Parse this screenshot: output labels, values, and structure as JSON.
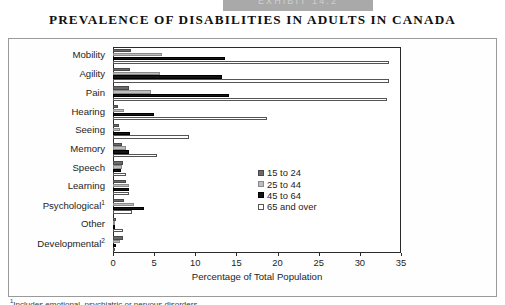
{
  "exhibit": {
    "band_label": "EXHIBIT 14.2"
  },
  "title": "PREVALENCE OF DISABILITIES IN ADULTS IN CANADA",
  "footnote": "Includes emotional, psychiatric or nervous disorders.",
  "chart_data": {
    "type": "bar",
    "orientation": "horizontal",
    "title": "PREVALENCE OF DISABILITIES IN ADULTS IN CANADA",
    "xlabel": "Percentage of Total Population",
    "ylabel": "",
    "xlim": [
      0,
      35
    ],
    "xticks": [
      0,
      5,
      10,
      15,
      20,
      25,
      30,
      35
    ],
    "grid": false,
    "legend_position": "center-right",
    "categories": [
      "Mobility",
      "Agility",
      "Pain",
      "Hearing",
      "Seeing",
      "Memory",
      "Speech",
      "Learning",
      "Psychological",
      "Other",
      "Developmental"
    ],
    "category_footnote_marks": {
      "Psychological": "1",
      "Developmental": "2"
    },
    "series": [
      {
        "name": "15 to 24",
        "color": "#6a6a6a",
        "values": [
          2.2,
          2.1,
          1.9,
          0.6,
          0.7,
          1.1,
          1.2,
          1.6,
          1.3,
          0.4,
          1.2
        ]
      },
      {
        "name": "25 to 44",
        "color": "#bdbdbd",
        "values": [
          5.9,
          5.7,
          4.6,
          1.3,
          0.8,
          1.6,
          1.1,
          1.9,
          2.5,
          0.3,
          0.8
        ]
      },
      {
        "name": "45 to 64",
        "color": "#141414",
        "values": [
          13.6,
          13.3,
          14.1,
          5.0,
          2.1,
          2.0,
          1.0,
          2.0,
          3.8,
          0.3,
          0.4
        ]
      },
      {
        "name": "65 and over",
        "color": "#ffffff",
        "values": [
          33.5,
          33.6,
          33.3,
          18.7,
          9.2,
          5.3,
          1.6,
          2.0,
          2.3,
          1.2,
          0.2
        ]
      }
    ]
  },
  "legend": {
    "items": [
      {
        "label": "15 to 24"
      },
      {
        "label": "25 to 44"
      },
      {
        "label": "45 to 64"
      },
      {
        "label": "65 and over"
      }
    ]
  }
}
